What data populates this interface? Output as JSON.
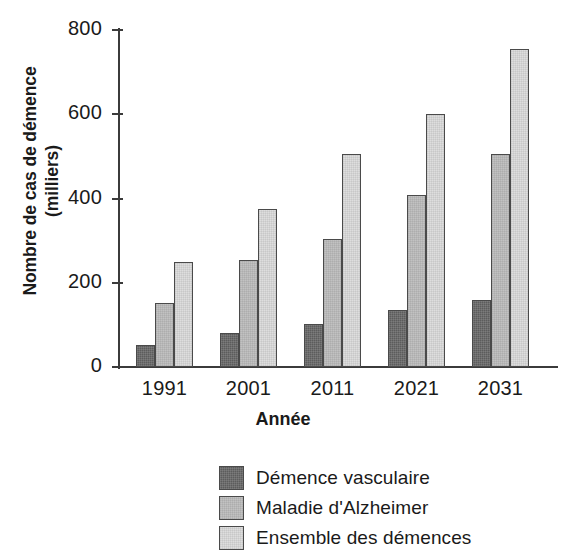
{
  "chart_data": {
    "type": "bar",
    "title": "",
    "xlabel": "Année",
    "ylabel": "Nombre de cas de démence (milliers)",
    "ylabel_line1": "Nombre de cas de démence",
    "ylabel_line2": "(milliers)",
    "categories": [
      "1991",
      "2001",
      "2011",
      "2021",
      "2031"
    ],
    "ylim": [
      0,
      800
    ],
    "yticks": [
      0,
      200,
      400,
      600,
      800
    ],
    "ytick_labels": [
      "0",
      "200",
      "400",
      "600",
      "800"
    ],
    "grid": false,
    "legend_position": "bottom-center",
    "series": [
      {
        "name": "Démence vasculaire",
        "color": "#5c5c5c",
        "values": [
          52,
          80,
          103,
          135,
          158
        ]
      },
      {
        "name": "Maladie d'Alzheimer",
        "color": "#c2c2c2",
        "values": [
          152,
          255,
          305,
          408,
          506
        ]
      },
      {
        "name": "Ensemble des démences",
        "color": "#dedede",
        "values": [
          250,
          375,
          505,
          600,
          755
        ]
      }
    ]
  }
}
